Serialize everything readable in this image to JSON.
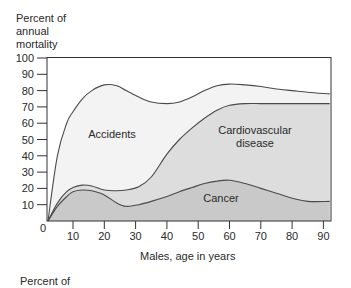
{
  "chart_data": {
    "type": "area",
    "stacked": true,
    "title": "",
    "ylabel_lines": [
      "Percent of",
      "annual",
      "mortality"
    ],
    "xlabel": "Males, age in years",
    "ylim": [
      0,
      100
    ],
    "xlim": [
      2,
      92
    ],
    "y_ticks": [
      0,
      10,
      20,
      30,
      40,
      50,
      60,
      70,
      80,
      90,
      100
    ],
    "x_ticks": [
      10,
      20,
      30,
      40,
      50,
      60,
      70,
      80,
      90
    ],
    "grid": false,
    "legend": "inline labels",
    "x": [
      2,
      5,
      8,
      10,
      13,
      16,
      20,
      24,
      27,
      31,
      35,
      40,
      44,
      48,
      52,
      56,
      60,
      65,
      70,
      75,
      80,
      85,
      92
    ],
    "series": [
      {
        "name": "Cancer",
        "cumulative_top": [
          0,
          9,
          15,
          18,
          19,
          18.5,
          16,
          11,
          9,
          10,
          12,
          15,
          18,
          20.5,
          23,
          24.5,
          25,
          23,
          20,
          17,
          14,
          12,
          12
        ],
        "fill": "#c9c9c9",
        "label": "Cancer"
      },
      {
        "name": "Cardiovascular disease",
        "cumulative_top": [
          0,
          11,
          18,
          20.5,
          22,
          21.5,
          19,
          18.5,
          19,
          21,
          27,
          41,
          50,
          57,
          63,
          68,
          71,
          72,
          72,
          72,
          72,
          72,
          72
        ],
        "fill": "#dddddd",
        "label_lines": [
          "Cardiovascular",
          "disease"
        ]
      },
      {
        "name": "Accidents",
        "cumulative_top": [
          0,
          40,
          60,
          67,
          75,
          80,
          83.5,
          83,
          80,
          76,
          73,
          72,
          73,
          76,
          80,
          83,
          84,
          83.5,
          82.5,
          81,
          80,
          79,
          78
        ],
        "fill": "#f3f3f3",
        "label": "Accidents"
      }
    ]
  },
  "footer_text": "Percent of",
  "colors": {
    "line": "#4a4a4a",
    "frame": "#333333",
    "background": "#ffffff"
  }
}
